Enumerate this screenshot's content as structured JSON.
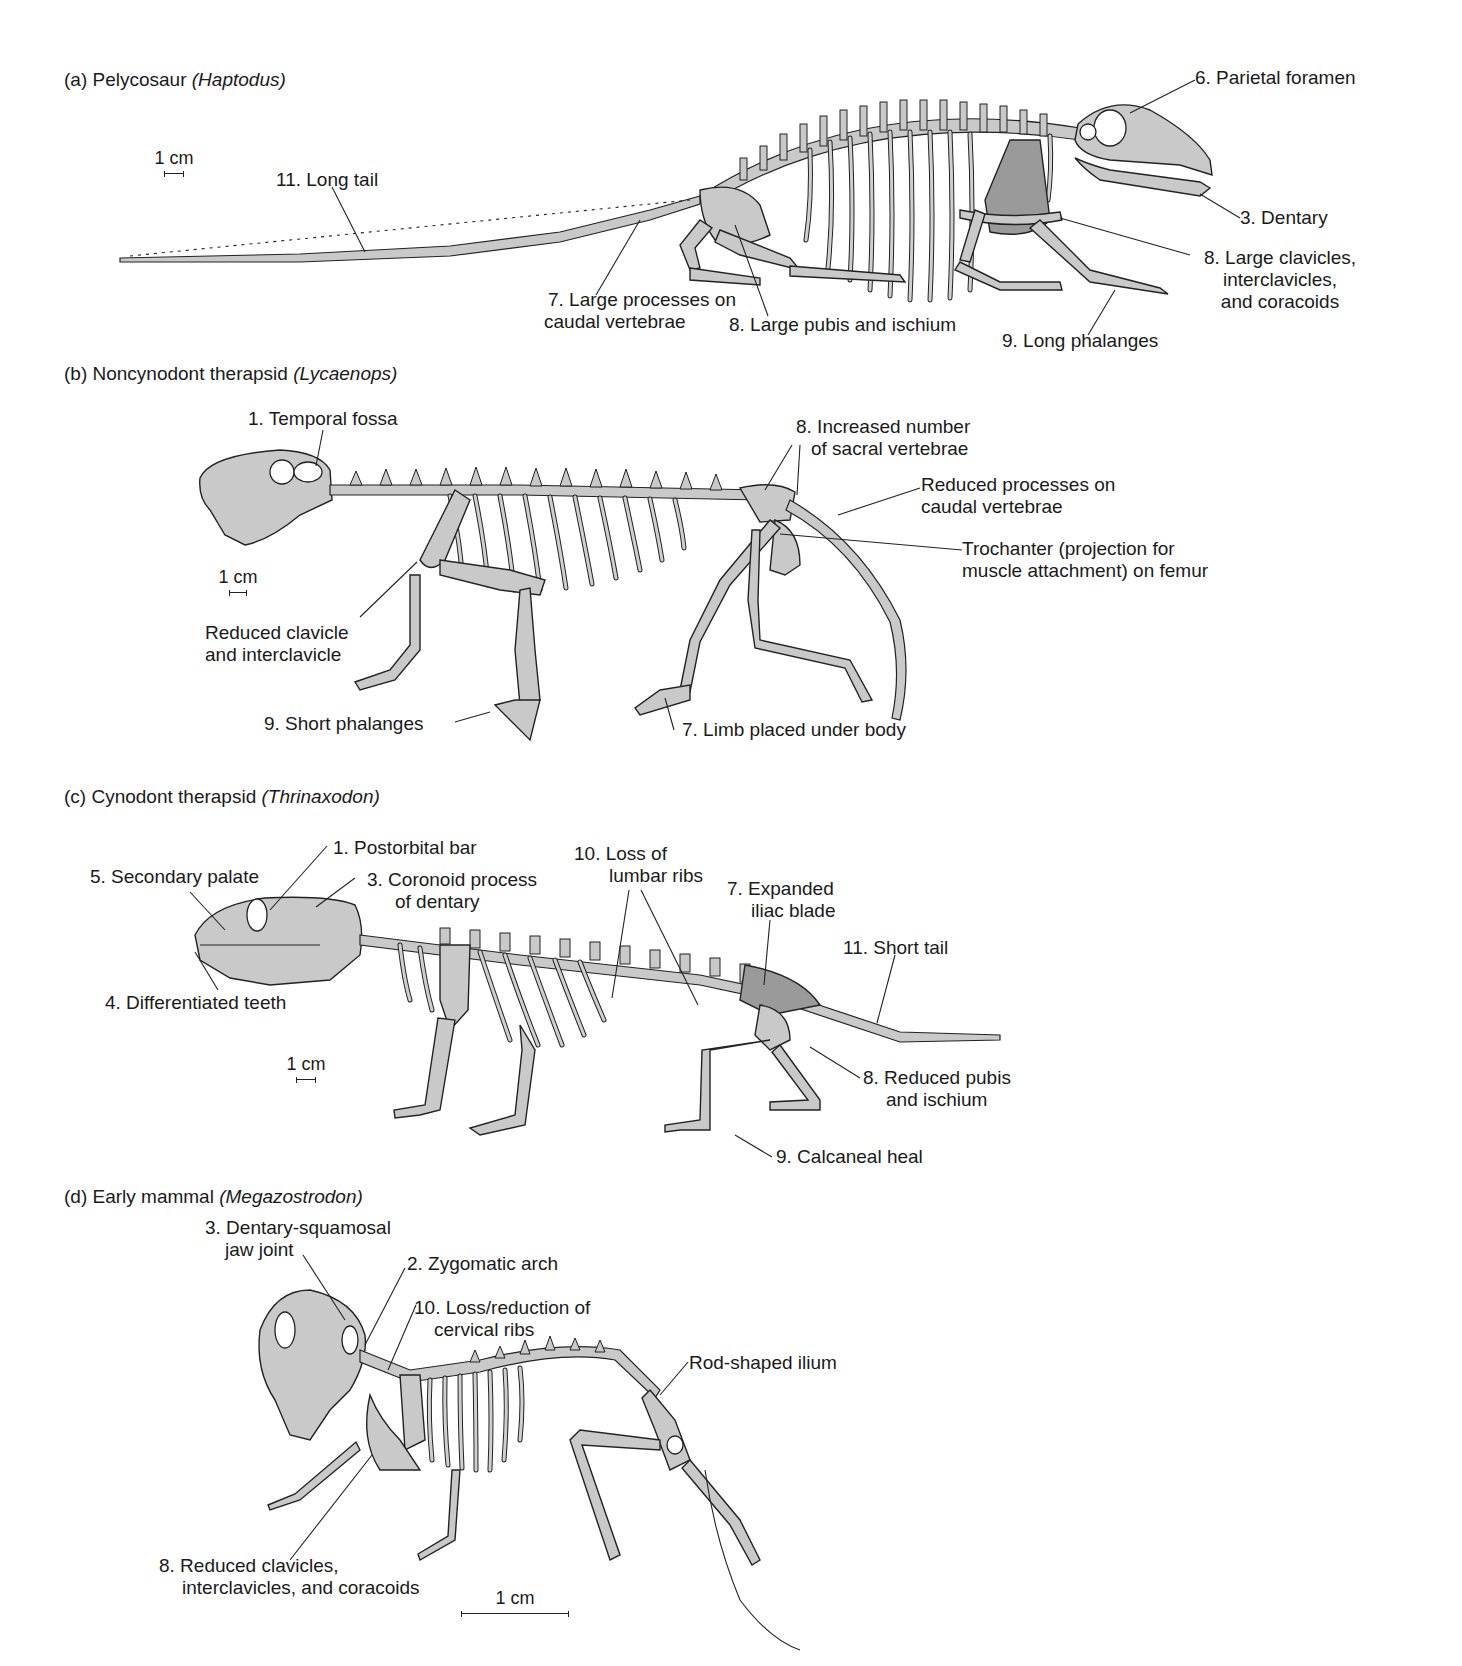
{
  "figure": {
    "panels": [
      {
        "id": "a",
        "prefix": "(a) Pelycosaur ",
        "genus": "(Haptodus)",
        "scale_label": "1 cm",
        "labels": {
          "parietal_foramen": "6. Parietal foramen",
          "long_tail": "11. Long tail",
          "dentary": "3. Dentary",
          "clavicles_1": "8. Large clavicles,",
          "clavicles_2": "interclavicles,",
          "clavicles_3": "and coracoids",
          "caudal_1": "7. Large processes on",
          "caudal_2": "caudal vertebrae",
          "pubis": "8. Large pubis and ischium",
          "phalanges": "9. Long phalanges"
        }
      },
      {
        "id": "b",
        "prefix": "(b) Noncynodont therapsid ",
        "genus": "(Lycaenops)",
        "scale_label": "1 cm",
        "labels": {
          "temporal_fossa": "1. Temporal fossa",
          "sacral_1": "8. Increased number",
          "sacral_2": "of sacral vertebrae",
          "reduced_caudal_1": "Reduced processes on",
          "reduced_caudal_2": "caudal vertebrae",
          "trochanter_1": "Trochanter (projection for",
          "trochanter_2": "muscle attachment) on femur",
          "clavicle_1": "Reduced clavicle",
          "clavicle_2": "and interclavicle",
          "short_phalanges": "9. Short  phalanges",
          "limb_under_body": "7. Limb placed under body"
        }
      },
      {
        "id": "c",
        "prefix": "(c) Cynodont therapsid ",
        "genus": "(Thrinaxodon)",
        "scale_label": "1 cm",
        "labels": {
          "postorbital_bar": "1. Postorbital bar",
          "secondary_palate": "5. Secondary palate",
          "coronoid_1": "3. Coronoid process",
          "coronoid_2": "of dentary",
          "lumbar_1": "10. Loss of",
          "lumbar_2": "lumbar ribs",
          "iliac_1": "7. Expanded",
          "iliac_2": "iliac blade",
          "short_tail": "11. Short tail",
          "teeth": "4. Differentiated teeth",
          "pubis_1": "8. Reduced pubis",
          "pubis_2": "and ischium",
          "calcaneal": "9. Calcaneal heal"
        }
      },
      {
        "id": "d",
        "prefix": "(d) Early mammal ",
        "genus": "(Megazostrodon)",
        "scale_label": "1 cm",
        "labels": {
          "jaw_1": "3. Dentary-squamosal",
          "jaw_2": "jaw joint",
          "zygomatic": "2. Zygomatic arch",
          "cervical_1": "10. Loss/reduction of",
          "cervical_2": "cervical ribs",
          "ilium": "Rod-shaped ilium",
          "clavicles_1": "8. Reduced clavicles,",
          "clavicles_2": "interclavicles, and coracoids"
        }
      }
    ],
    "colors": {
      "bone": "#c9c9c9",
      "ink": "#222222",
      "background": "#ffffff"
    }
  }
}
